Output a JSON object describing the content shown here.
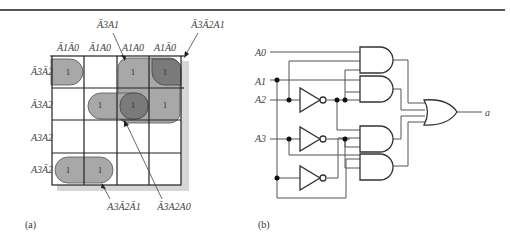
{
  "figure": {
    "panel_a": {
      "caption": "(a)",
      "column_headers": [
        "Ā1Ā0",
        "Ā1A0",
        "A1A0",
        "A1Ā0"
      ],
      "row_headers": [
        "Ā3Ā2",
        "Ā3A2",
        "A3A2",
        "A3Ā2"
      ],
      "cells": [
        [
          "1",
          "",
          "1",
          "1"
        ],
        [
          "",
          "1",
          "1",
          "1"
        ],
        [
          "",
          "",
          "",
          ""
        ],
        [
          "1",
          "1",
          "",
          ""
        ]
      ],
      "annotations": {
        "top_left": "Ā3A1",
        "top_right": "Ā3Ā2A1",
        "bottom_left": "A3Ā2Ā1",
        "bottom_right": "Ā3A2A0"
      },
      "group_colors": {
        "light": "#a8a8a8",
        "dark": "#7a7a7a"
      }
    },
    "panel_b": {
      "caption": "(b)",
      "inputs": [
        "A0",
        "A1",
        "A2",
        "A3"
      ],
      "output": "a",
      "gates": {
        "and": 4,
        "or": 1,
        "not": 3
      }
    }
  }
}
